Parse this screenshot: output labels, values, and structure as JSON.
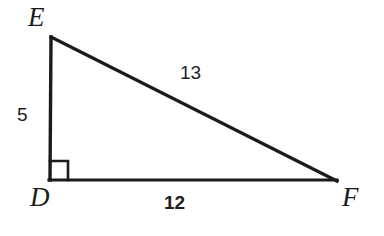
{
  "figure": {
    "background_color": "#ffffff",
    "stroke_color": "#1b1b1b",
    "stroke_width": 3,
    "vertices": [
      {
        "id": "E",
        "label": "E",
        "x": 51,
        "y": 37,
        "label_x": 28,
        "label_y": 4
      },
      {
        "id": "D",
        "label": "D",
        "x": 50,
        "y": 180,
        "label_x": 30,
        "label_y": 184
      },
      {
        "id": "F",
        "label": "F",
        "x": 336,
        "y": 180,
        "label_x": 342,
        "label_y": 184
      }
    ],
    "sides": [
      {
        "id": "DE",
        "name": "vertical-leg",
        "length": "5",
        "bold": false,
        "label_x": 17,
        "label_y": 105
      },
      {
        "id": "EF",
        "name": "hypotenuse",
        "length": "13",
        "bold": false,
        "label_x": 180,
        "label_y": 63
      },
      {
        "id": "DF",
        "name": "horizontal-leg",
        "length": "12",
        "bold": true,
        "label_x": 164,
        "label_y": 193
      }
    ],
    "right_angle": {
      "at_vertex": "D",
      "marker_size": 18,
      "marker_x": 50,
      "marker_y": 180
    }
  }
}
